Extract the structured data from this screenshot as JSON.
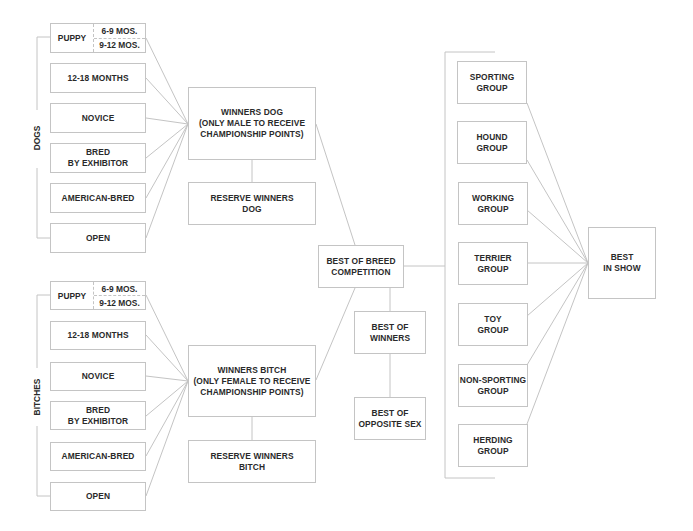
{
  "diagram": {
    "type": "dog show competition flowchart",
    "line_color": "#c4c4c4",
    "text_color": "#2a2a2a",
    "dogs": {
      "side_label": "DOGS",
      "classes": [
        {
          "label": "PUPPY",
          "subclasses": [
            "6-9 MOS.",
            "9-12 MOS."
          ]
        },
        {
          "label": "12-18 MONTHS"
        },
        {
          "label": "NOVICE"
        },
        {
          "label": "BRED\nBY EXHIBITOR"
        },
        {
          "label": "AMERICAN-BRED"
        },
        {
          "label": "OPEN"
        }
      ],
      "winners": "WINNERS DOG\n(ONLY MALE TO RECEIVE\nCHAMPIONSHIP POINTS)",
      "reserve": "RESERVE WINNERS\nDOG"
    },
    "bitches": {
      "side_label": "BITCHES",
      "classes": [
        {
          "label": "PUPPY",
          "subclasses": [
            "6-9 MOS.",
            "9-12 MOS."
          ]
        },
        {
          "label": "12-18 MONTHS"
        },
        {
          "label": "NOVICE"
        },
        {
          "label": "BRED\nBY EXHIBITOR"
        },
        {
          "label": "AMERICAN-BRED"
        },
        {
          "label": "OPEN"
        }
      ],
      "winners": "WINNERS BITCH\n(ONLY FEMALE TO RECEIVE\nCHAMPIONSHIP POINTS)",
      "reserve": "RESERVE WINNERS\nBITCH"
    },
    "best_of_breed": "BEST OF BREED\nCOMPETITION",
    "best_of_winners": "BEST OF\nWINNERS",
    "best_of_opposite_sex": "BEST OF\nOPPOSITE SEX",
    "groups": [
      "SPORTING\nGROUP",
      "HOUND\nGROUP",
      "WORKING\nGROUP",
      "TERRIER\nGROUP",
      "TOY\nGROUP",
      "NON-SPORTING\nGROUP",
      "HERDING\nGROUP"
    ],
    "best_in_show": "BEST\nIN SHOW"
  }
}
